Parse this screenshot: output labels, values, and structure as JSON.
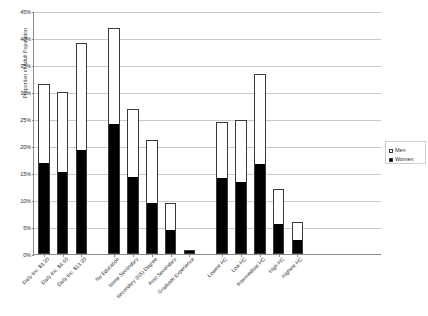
{
  "chart_data": {
    "type": "bar",
    "subtype": "stacked-bar-grouped",
    "title": "",
    "xlabel": "",
    "ylabel": "Proportion of Adult Population",
    "ylim": [
      0,
      45
    ],
    "ytick_labels": [
      "0%",
      "5%",
      "10%",
      "15%",
      "20%",
      "25%",
      "30%",
      "35%",
      "40%",
      "45%"
    ],
    "ytick_values": [
      0,
      5,
      10,
      15,
      20,
      25,
      30,
      35,
      40,
      45
    ],
    "grid": true,
    "legend_position": "right",
    "units": "percent",
    "categories": [
      "Daily Inc. $3.30",
      "Daily Inc. $6.60",
      "Daily Inc. $13.30",
      "No Education",
      "Some Secondary",
      "Secondary (HS) Degree",
      "Post Secondary",
      "Graduate Experience",
      "Lowest HC",
      "Low HC",
      "Intermediate HC",
      "High HC",
      "Highest HC"
    ],
    "groups": [
      {
        "name": "Income",
        "categories": [
          "Daily Inc. $3.30",
          "Daily Inc. $6.60",
          "Daily Inc. $13.30"
        ]
      },
      {
        "name": "Education",
        "categories": [
          "No Education",
          "Some Secondary",
          "Secondary (HS) Degree",
          "Post Secondary",
          "Graduate Experience"
        ]
      },
      {
        "name": "Human Capital",
        "categories": [
          "Lowest HC",
          "Low HC",
          "Intermediate HC",
          "High HC",
          "Highest HC"
        ]
      }
    ],
    "series": [
      {
        "name": "Women",
        "color": "#000000",
        "values": [
          16.7,
          15.0,
          19.0,
          23.8,
          14.0,
          9.3,
          4.2,
          0.4,
          13.9,
          13.2,
          16.5,
          5.3,
          2.5
        ]
      },
      {
        "name": "Men",
        "color": "#ffffff",
        "values": [
          14.8,
          15.0,
          20.0,
          18.0,
          12.8,
          11.9,
          5.3,
          0.3,
          10.6,
          11.6,
          16.8,
          6.7,
          3.5
        ]
      }
    ],
    "totals": [
      31.5,
      30.0,
      39.0,
      41.8,
      26.8,
      21.2,
      9.5,
      0.7,
      24.5,
      24.8,
      33.3,
      12.0,
      6.0
    ]
  },
  "legend": {
    "items": [
      {
        "label": "Men",
        "swatch": "men"
      },
      {
        "label": "Women",
        "swatch": "women"
      }
    ]
  }
}
